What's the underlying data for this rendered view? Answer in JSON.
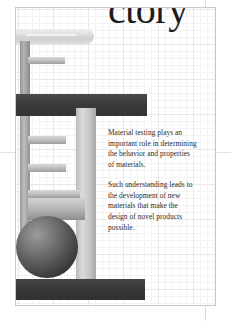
{
  "document": {
    "title_visible": "ctory",
    "title_full": "Laboratory",
    "paragraphs": [
      "Material testing plays an important role in determining the behavior and properties of materials.",
      "Such understanding leads to the development of new materials that make the design of novel products possible."
    ]
  },
  "illustration": {
    "name": "universal-testing-machine",
    "parts": [
      "rounded-crosshead-bar",
      "vertical-post-upper",
      "vertical-post-lower",
      "grip-tab-1",
      "grip-tab-2",
      "grip-tab-3",
      "grip-tab-4",
      "specimen-holder-block",
      "dark-crossbar",
      "vertical-column",
      "load-cell-sphere",
      "dark-base-bar"
    ]
  },
  "colors": {
    "page_background": "#ffffff",
    "grid_minor_line": "#f3f3f3",
    "grid_major_line": "#e8e8e8",
    "dark_bar": "#3b3b3b",
    "mid_gray": "#bcbcbc",
    "light_gray": "#e3e3e3",
    "text": "#2b2b2b",
    "title_text": "#1c1c1c",
    "sheet_border": "#c9c9c9"
  }
}
